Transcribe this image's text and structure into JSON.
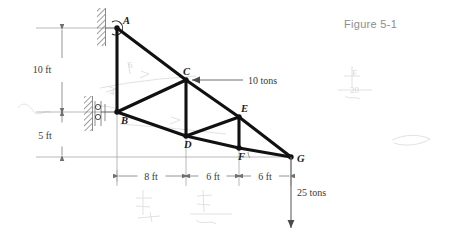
{
  "figure": {
    "title": "Figure 5-1",
    "type": "statics-truss-diagram"
  },
  "joints": [
    {
      "id": "A",
      "label": "A",
      "x": 117,
      "y": 28,
      "label_dx": 6,
      "label_dy": -4,
      "support": "pin"
    },
    {
      "id": "B",
      "label": "B",
      "x": 117,
      "y": 112,
      "label_dx": 4,
      "label_dy": 12,
      "support": "roller"
    },
    {
      "id": "C",
      "label": "C",
      "x": 186,
      "y": 80,
      "label_dx": -3,
      "label_dy": -5,
      "support": "none"
    },
    {
      "id": "D",
      "label": "D",
      "x": 186,
      "y": 136,
      "label_dx": -2,
      "label_dy": 12,
      "support": "none"
    },
    {
      "id": "E",
      "label": "E",
      "x": 239,
      "y": 117,
      "label_dx": 2,
      "label_dy": -5,
      "support": "none"
    },
    {
      "id": "F",
      "label": "F",
      "x": 239,
      "y": 148,
      "label_dx": -1,
      "label_dy": 12,
      "support": "none"
    },
    {
      "id": "G",
      "label": "G",
      "x": 291,
      "y": 157,
      "label_dx": 6,
      "label_dy": 5,
      "support": "none"
    }
  ],
  "members": [
    {
      "from": "A",
      "to": "B"
    },
    {
      "from": "A",
      "to": "C"
    },
    {
      "from": "C",
      "to": "B"
    },
    {
      "from": "C",
      "to": "D"
    },
    {
      "from": "C",
      "to": "E"
    },
    {
      "from": "B",
      "to": "D"
    },
    {
      "from": "D",
      "to": "E"
    },
    {
      "from": "D",
      "to": "F"
    },
    {
      "from": "E",
      "to": "F"
    },
    {
      "from": "E",
      "to": "G"
    },
    {
      "from": "F",
      "to": "G"
    }
  ],
  "loads": [
    {
      "name": "load-at-C",
      "label": "10 tons",
      "magnitude": 10,
      "unit": "tons",
      "at_joint": "C",
      "direction": "left",
      "tail_x": 243,
      "tail_y": 80,
      "head_x": 192,
      "head_y": 80,
      "label_x": 248,
      "label_y": 84
    },
    {
      "name": "load-at-G",
      "label": "25 tons",
      "magnitude": 25,
      "unit": "tons",
      "at_joint": "G",
      "direction": "down",
      "tail_x": 291,
      "tail_y": 157,
      "head_x": 291,
      "head_y": 228,
      "label_x": 297,
      "label_y": 196
    }
  ],
  "dimensions": {
    "horizontal": {
      "baseline_y": 176,
      "segments": [
        {
          "label": "8 ft",
          "value": 8,
          "unit": "ft",
          "x1": 117,
          "x2": 186,
          "label_x": 151,
          "label_y": 180
        },
        {
          "label": "6 ft",
          "value": 6,
          "unit": "ft",
          "x1": 186,
          "x2": 239,
          "label_x": 213,
          "label_y": 180
        },
        {
          "label": "6 ft",
          "value": 6,
          "unit": "ft",
          "x1": 239,
          "x2": 291,
          "label_x": 265,
          "label_y": 180
        }
      ]
    },
    "vertical": {
      "axis_x": 62,
      "segments": [
        {
          "label": "10 ft",
          "value": 10,
          "unit": "ft",
          "y1": 28,
          "y2": 112,
          "label_x": 42,
          "label_y": 73
        },
        {
          "label": "5 ft",
          "value": 5,
          "unit": "ft",
          "y1": 112,
          "y2": 157,
          "label_x": 45,
          "label_y": 139
        }
      ]
    }
  },
  "supports": {
    "A": {
      "kind": "pin-on-wall",
      "wall_x": 103,
      "wall_y_top": 8,
      "wall_y_bottom": 45
    },
    "B": {
      "kind": "roller-on-wall",
      "wall_x": 90,
      "wall_y_top": 96,
      "wall_y_bottom": 131
    }
  },
  "annotations": {
    "title_x": 344,
    "title_y": 28,
    "pencil_marks": [
      {
        "text": "F",
        "x": 352,
        "y": 76
      },
      {
        "text": "20",
        "x": 350,
        "y": 93
      },
      {
        "text": "6",
        "x": 128,
        "y": 68
      },
      {
        "text": "4",
        "x": 110,
        "y": 95
      }
    ]
  }
}
